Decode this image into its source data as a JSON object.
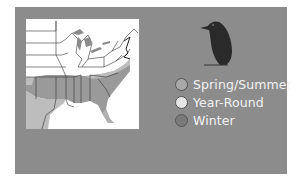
{
  "legend": {
    "items": [
      {
        "label": "Spring/Summer",
        "color": "#a9a9a9"
      },
      {
        "label": "Year-Round",
        "color": "#e6e6e6"
      },
      {
        "label": "Winter",
        "color": "#7a7a7a"
      }
    ]
  },
  "map": {
    "region": "Eastern United States",
    "colors": {
      "land": "#ffffff",
      "spring_summer": "#bdbdbd",
      "year_round": "#9a9a9a",
      "border": "#333333"
    }
  },
  "bird": {
    "icon": "bird-silhouette-icon",
    "color": "#2a2a2a"
  }
}
